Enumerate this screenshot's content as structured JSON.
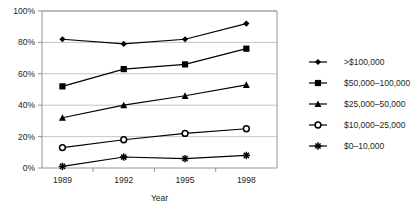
{
  "chart_data": {
    "type": "line",
    "title": "",
    "xlabel": "Year",
    "ylabel": "",
    "categories": [
      "1989",
      "1992",
      "1995",
      "1998"
    ],
    "x": [
      1989,
      1992,
      1995,
      1998
    ],
    "xlim": [
      1988,
      1999.5
    ],
    "ylim": [
      0,
      100
    ],
    "yticks": [
      "0%",
      "20%",
      "40%",
      "60%",
      "80%",
      "100%"
    ],
    "ytick_values": [
      0,
      20,
      40,
      60,
      80,
      100
    ],
    "grid": "horizontal",
    "legend_position": "right",
    "series": [
      {
        "name": ">$100,000",
        "marker": "diamond",
        "color": "#000000",
        "values": [
          82,
          79,
          82,
          92
        ]
      },
      {
        "name": "$50,000–100,000",
        "marker": "square",
        "color": "#000000",
        "values": [
          52,
          63,
          66,
          76
        ]
      },
      {
        "name": "$25,000–50,000",
        "marker": "triangle",
        "color": "#000000",
        "values": [
          32,
          40,
          46,
          53
        ]
      },
      {
        "name": "$10,000–25,000",
        "marker": "open-circle",
        "color": "#000000",
        "values": [
          13,
          18,
          22,
          25
        ]
      },
      {
        "name": "$0–10,000",
        "marker": "star",
        "color": "#000000",
        "values": [
          1,
          7,
          6,
          8
        ]
      }
    ]
  },
  "axes": {
    "x_title": "Year",
    "y_ticks": [
      "100%",
      "80%",
      "60%",
      "40%",
      "20%",
      "0%"
    ],
    "x_ticks": [
      "1989",
      "1992",
      "1995",
      "1998"
    ]
  },
  "legend": {
    "entries": [
      {
        "label": ">$100,000"
      },
      {
        "label": "$50,000–100,000"
      },
      {
        "label": "$25,000–50,000"
      },
      {
        "label": "$10,000–25,000"
      },
      {
        "label": "$0–10,000"
      }
    ]
  },
  "colors": {
    "ink": "#231f20",
    "grid": "#b8b8b8",
    "frame": "#8a8a8a",
    "marker": "#000000"
  }
}
